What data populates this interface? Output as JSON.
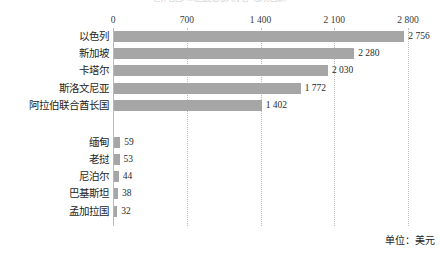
{
  "chart_title": "世界各国人均国民总收入排名（部分国家）",
  "unit_note": "单位：美元",
  "axis": {
    "ticks": [
      "0",
      "700",
      "1 400",
      "2 100",
      "2 800"
    ],
    "tick_values": [
      0,
      700,
      1400,
      2100,
      2800
    ]
  },
  "chart_data": {
    "type": "bar",
    "orientation": "horizontal",
    "title": "世界各国人均国民总收入排名（部分国家）",
    "xlabel": "",
    "ylabel": "",
    "xlim": [
      0,
      2800
    ],
    "grid": true,
    "legend": null,
    "unit": "美元",
    "categories": [
      "以色列",
      "新加坡",
      "卡塔尔",
      "斯洛文尼亚",
      "阿拉伯联合酋长国",
      "缅甸",
      "老挝",
      "尼泊尔",
      "巴基斯坦",
      "孟加拉国"
    ],
    "values": [
      2756,
      2280,
      2030,
      1772,
      1402,
      59,
      53,
      44,
      38,
      32
    ],
    "value_labels": [
      "2 756",
      "2 280",
      "2 030",
      "1 772",
      "1 402",
      "59",
      "53",
      "44",
      "38",
      "32"
    ],
    "bar_color": "#a6a6a6",
    "group_break_after_index": 4
  }
}
